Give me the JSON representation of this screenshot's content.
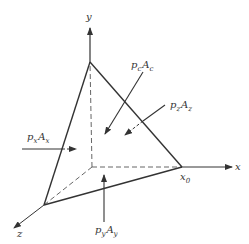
{
  "figure": {
    "axes": {
      "x": "x",
      "y": "y",
      "z": "z"
    },
    "points": {
      "x0": "x",
      "x0_sub": "0"
    },
    "forces": {
      "px": {
        "p": "p",
        "p_sub": "x",
        "A": "A",
        "A_sub": "x"
      },
      "py": {
        "p": "p",
        "p_sub": "y",
        "A": "A",
        "A_sub": "y"
      },
      "pz": {
        "p": "p",
        "p_sub": "z",
        "A": "A",
        "A_sub": "z"
      },
      "pc": {
        "p": "p",
        "p_sub": "c",
        "A": "A",
        "A_sub": "c"
      }
    },
    "colors": {
      "line": "#333333",
      "background": "#ffffff"
    }
  }
}
